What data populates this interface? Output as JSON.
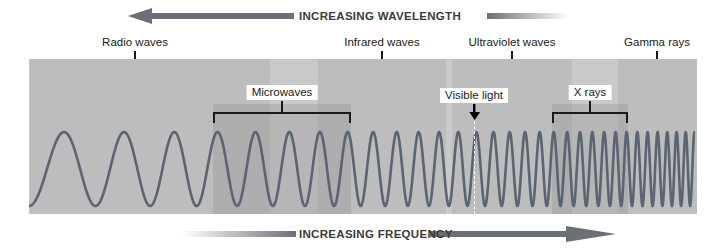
{
  "figure": {
    "width": 719,
    "height": 248,
    "background": "#ffffff",
    "panel": {
      "x": 29,
      "y": 59,
      "width": 666,
      "height": 155,
      "color": "#c9c9c9"
    }
  },
  "top_axis": {
    "label": "INCREASING WAVELENGTH",
    "direction": "left",
    "color": "#6b7078",
    "label_x": 296,
    "label_y": 12,
    "arrow_head_x": 128,
    "bar_left": 152,
    "bar_right": 293,
    "tail_left": 487,
    "tail_right": 567
  },
  "bottom_axis": {
    "label": "INCREASING FREQUENCY",
    "direction": "right",
    "color": "#6b7078",
    "label_x": 296,
    "label_y": 230,
    "arrow_head_x": 592,
    "bar_left": 430,
    "bar_right": 566,
    "tail_left": 182,
    "tail_right": 296
  },
  "bands": [
    {
      "name": "radio-waves",
      "label": "Radio waves",
      "row": "upper",
      "x": 30,
      "width": 240,
      "label_x": 135,
      "label_y": 36,
      "boxed": false,
      "shade": "upper"
    },
    {
      "name": "microwaves",
      "label": "Microwaves",
      "row": "lower",
      "x": 213,
      "width": 138,
      "label_x": 282,
      "label_y": 85,
      "boxed": true,
      "shade": "lower"
    },
    {
      "name": "infrared-waves",
      "label": "Infrared waves",
      "row": "upper",
      "x": 318,
      "width": 128,
      "label_x": 382,
      "label_y": 36,
      "boxed": false,
      "shade": "upper"
    },
    {
      "name": "visible-light",
      "label": "Visible light",
      "row": "marker",
      "x": 474,
      "width": 0,
      "label_x": 474,
      "label_y": 88,
      "boxed": true,
      "shade": "none"
    },
    {
      "name": "ultraviolet-waves",
      "label": "Ultraviolet waves",
      "row": "upper",
      "x": 452,
      "width": 120,
      "label_x": 512,
      "label_y": 36,
      "boxed": false,
      "shade": "upper"
    },
    {
      "name": "x-rays",
      "label": "X rays",
      "row": "lower",
      "x": 552,
      "width": 76,
      "label_x": 590,
      "label_y": 85,
      "boxed": true,
      "shade": "lower"
    },
    {
      "name": "gamma-rays",
      "label": "Gamma rays",
      "row": "upper",
      "x": 618,
      "width": 79,
      "label_x": 657,
      "label_y": 36,
      "boxed": false,
      "shade": "upper"
    }
  ],
  "wave": {
    "color": "#5a6472",
    "stroke_width": 2.6,
    "baseline_y": 169,
    "amplitude": 37,
    "start_cycles_per_100px": 1.35,
    "end_cycles_per_100px": 11.5,
    "description": "Sine wave whose frequency increases exponentially from left (long wavelength) to right (short wavelength)"
  },
  "visible_marker": {
    "dash_x": 474,
    "dash_top": 112,
    "dash_bottom": 214,
    "dash_color": "#ffffff",
    "arrow_color": "#000000",
    "arrow_x": 474,
    "arrow_top": 103,
    "arrow_bottom": 118
  },
  "chart_data": {
    "type": "diagram",
    "categories": [
      "Radio waves",
      "Microwaves",
      "Infrared waves",
      "Visible light",
      "Ultraviolet waves",
      "X rays",
      "Gamma rays"
    ],
    "axis_left_to_right": "increasing frequency / decreasing wavelength",
    "annotations": [
      "INCREASING WAVELENGTH",
      "INCREASING FREQUENCY",
      "Visible light"
    ]
  }
}
